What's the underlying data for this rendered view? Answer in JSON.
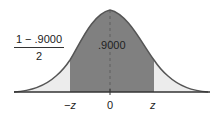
{
  "diagram": {
    "type": "normal-distribution-area",
    "center_area_label": ".9000",
    "tail_fraction": {
      "numerator": "1 − .9000",
      "denominator": "2"
    },
    "axis_labels": {
      "left": "−z",
      "center": "0",
      "right": "z"
    },
    "colors": {
      "center_fill": "#808080",
      "tail_fill": "#ececec",
      "curve": "#555555",
      "axis": "#333333"
    }
  }
}
